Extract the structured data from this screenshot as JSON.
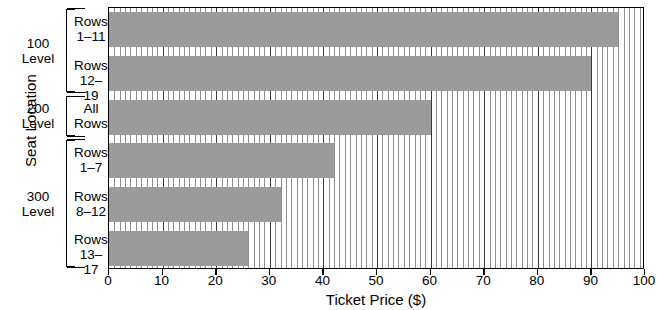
{
  "chart_data": {
    "type": "bar",
    "orientation": "horizontal",
    "title": "",
    "xlabel": "Ticket Price ($)",
    "ylabel": "Seat Location",
    "xlim": [
      0,
      100
    ],
    "xticks": [
      0,
      10,
      20,
      30,
      40,
      50,
      60,
      70,
      80,
      90,
      100
    ],
    "xtick_labels": [
      "0",
      "10",
      "20",
      "30",
      "40",
      "50",
      "60",
      "70",
      "80",
      "90",
      "100"
    ],
    "grid": "vertical-minor-every-1-major-every-10",
    "legend": "none",
    "bar_color": "#9b9b9b",
    "categories": [
      "Rows 1–11",
      "Rows 12–19",
      "All Rows",
      "Rows 1–7",
      "Rows 8–12",
      "Rows 13–17"
    ],
    "values": [
      95,
      90,
      60,
      42,
      32,
      26
    ],
    "groups": [
      {
        "label": "100 Level",
        "line1": "100",
        "line2": "Level",
        "categories": [
          "Rows 1–11",
          "Rows 12–19"
        ]
      },
      {
        "label": "200 Level",
        "line1": "200",
        "line2": "Level",
        "categories": [
          "All Rows"
        ]
      },
      {
        "label": "300 Level",
        "line1": "300",
        "line2": "Level",
        "categories": [
          "Rows 1–7",
          "Rows 8–12",
          "Rows 13–17"
        ]
      }
    ]
  },
  "axes": {
    "y_title": "Seat Location",
    "x_title": "Ticket Price ($)"
  },
  "category_labels": [
    {
      "line1": "Rows",
      "line2": "1–11"
    },
    {
      "line1": "Rows",
      "line2": "12–19"
    },
    {
      "line1": "All",
      "line2": "Rows"
    },
    {
      "line1": "Rows",
      "line2": "1–7"
    },
    {
      "line1": "Rows",
      "line2": "8–12"
    },
    {
      "line1": "Rows",
      "line2": "13–17"
    }
  ],
  "group_labels": [
    {
      "line1": "100",
      "line2": "Level"
    },
    {
      "line1": "200",
      "line2": "Level"
    },
    {
      "line1": "300",
      "line2": "Level"
    }
  ],
  "x_tick_labels": [
    "0",
    "10",
    "20",
    "30",
    "40",
    "50",
    "60",
    "70",
    "80",
    "90",
    "100"
  ]
}
